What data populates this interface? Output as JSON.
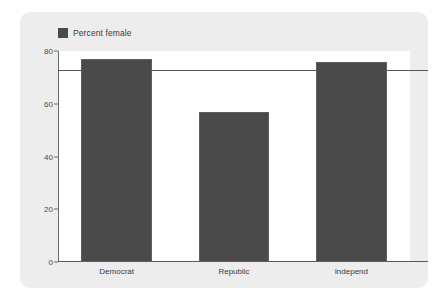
{
  "chart_data": {
    "type": "bar",
    "title": "",
    "xlabel": "",
    "ylabel": "",
    "categories": [
      "Democrat",
      "Republic",
      "Independ"
    ],
    "values": [
      77,
      57,
      76
    ],
    "series": [
      {
        "name": "Percent female",
        "values": [
          77,
          57,
          76
        ]
      }
    ],
    "ylim": [
      0,
      80
    ],
    "yticks": [
      0,
      20,
      40,
      60,
      80
    ],
    "ytick_labels": [
      "0",
      "20",
      "40",
      "60",
      "80"
    ],
    "grid": false,
    "legend": {
      "position": "top-left",
      "entries": [
        "Percent female"
      ]
    },
    "annotations": [
      {
        "type": "reference-line",
        "orientation": "horizontal",
        "value": 72.7
      }
    ],
    "colors": {
      "bar": "#4a4a4a",
      "bar_border": "#5e5e5e",
      "card_background": "#ededed",
      "plot_background": "#ffffff",
      "axis": "#5a5a5a",
      "reference_line": "#555555",
      "text": "#3a3a3a"
    }
  },
  "legend": {
    "label": "Percent female"
  },
  "axis": {
    "ticks": [
      {
        "label": "80",
        "value": 80
      },
      {
        "label": "60",
        "value": 60
      },
      {
        "label": "40",
        "value": 40
      },
      {
        "label": "20",
        "value": 20
      },
      {
        "label": "0",
        "value": 0
      }
    ]
  },
  "bars": [
    {
      "label": "Democrat",
      "value": 77
    },
    {
      "label": "Republic",
      "value": 57
    },
    {
      "label": "Independ",
      "value": 76
    }
  ]
}
